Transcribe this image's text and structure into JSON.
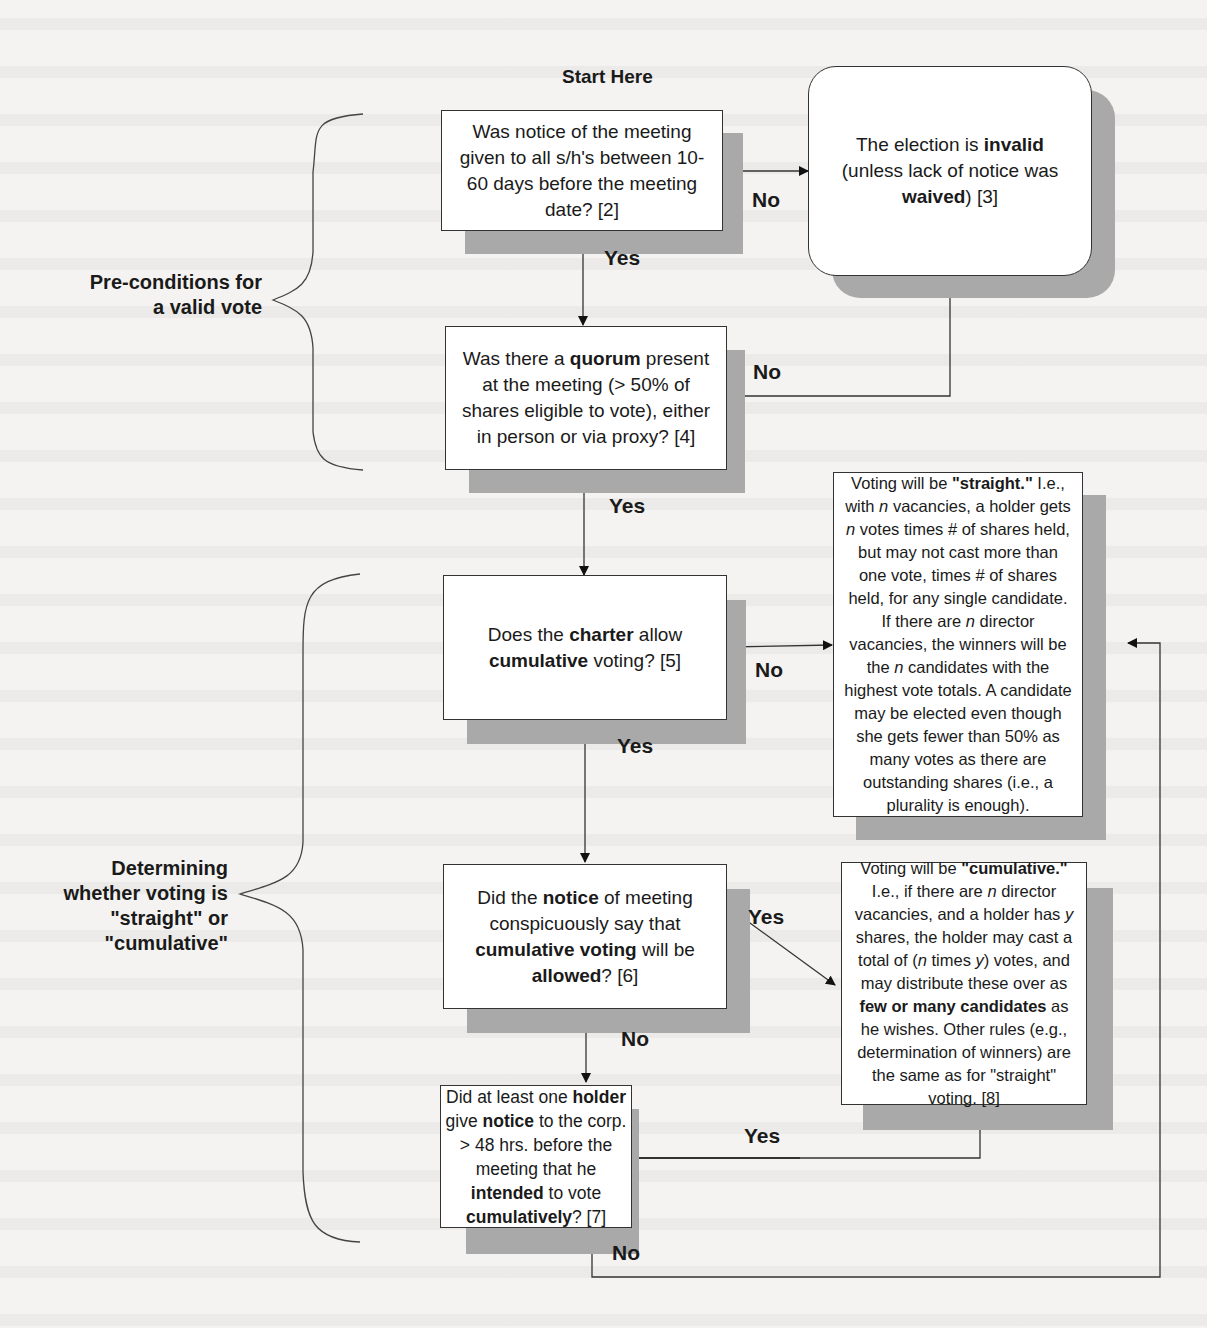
{
  "diagram": {
    "start_label": "Start Here",
    "side_labels": {
      "preconditions": [
        "Pre-conditions for",
        "a valid vote"
      ],
      "determining": [
        "Determining",
        "whether voting is",
        "\"straight\" or",
        "\"cumulative\""
      ]
    },
    "nodes": {
      "notice": {
        "segments": [
          {
            "t": "Was notice of the meeting given to all s/h's between 10-60 days before the meeting date? [2]"
          }
        ]
      },
      "invalid": {
        "segments": [
          {
            "t": "The election is  "
          },
          {
            "t": "invalid",
            "b": true
          },
          {
            "t": " (unless lack of notice was "
          },
          {
            "t": "waived",
            "b": true
          },
          {
            "t": ") [3]"
          }
        ]
      },
      "quorum": {
        "segments": [
          {
            "t": "Was there a "
          },
          {
            "t": "quorum",
            "b": true
          },
          {
            "t": " present at the meeting (> 50% of shares eligible to vote), either in person or via proxy? [4]"
          }
        ]
      },
      "charter": {
        "segments": [
          {
            "t": "Does the "
          },
          {
            "t": "charter",
            "b": true
          },
          {
            "t": " allow "
          },
          {
            "t": "cumulative",
            "b": true
          },
          {
            "t": " voting? [5]"
          }
        ]
      },
      "notice_cumulative": {
        "segments": [
          {
            "t": "Did the "
          },
          {
            "t": "notice",
            "b": true
          },
          {
            "t": " of meeting conspicuously say that "
          },
          {
            "t": "cumulative voting",
            "b": true
          },
          {
            "t": " will be "
          },
          {
            "t": "allowed",
            "b": true
          },
          {
            "t": "? [6]"
          }
        ]
      },
      "holder_notice": {
        "segments": [
          {
            "t": "Did at least one "
          },
          {
            "t": "holder",
            "b": true
          },
          {
            "t": " give "
          },
          {
            "t": "notice",
            "b": true
          },
          {
            "t": " to the corp. > 48 hrs. before the meeting that he "
          },
          {
            "t": "intended",
            "b": true
          },
          {
            "t": " to vote "
          },
          {
            "t": "cumulatively",
            "b": true
          },
          {
            "t": "? [7]"
          }
        ]
      },
      "straight": {
        "segments": [
          {
            "t": "Voting will be "
          },
          {
            "t": "\"straight.\"",
            "b": true
          },
          {
            "t": " I.e., with "
          },
          {
            "t": "n",
            "i": true
          },
          {
            "t": " vacancies, a holder gets "
          },
          {
            "t": "n",
            "i": true
          },
          {
            "t": " votes times # of shares held, but may not cast more than one vote, times # of shares held, for any single candidate. If there are "
          },
          {
            "t": "n",
            "i": true
          },
          {
            "t": " director vacancies, the winners will be the "
          },
          {
            "t": "n",
            "i": true
          },
          {
            "t": " candidates with the highest vote totals. A candidate may be elected even though she gets fewer than 50% as many votes as there are outstanding shares (i.e., a plurality is enough)."
          }
        ]
      },
      "cumulative": {
        "segments": [
          {
            "t": "Voting will be "
          },
          {
            "t": "\"cumulative.\"",
            "b": true
          },
          {
            "t": " I.e., if there are "
          },
          {
            "t": "n",
            "i": true
          },
          {
            "t": " director vacancies, and a holder has "
          },
          {
            "t": "y",
            "i": true
          },
          {
            "t": " shares, the holder may cast a total of ("
          },
          {
            "t": "n",
            "i": true
          },
          {
            "t": " times "
          },
          {
            "t": "y",
            "i": true
          },
          {
            "t": ") votes, and may distribute  these over as "
          },
          {
            "t": "few or many candidates",
            "b": true
          },
          {
            "t": " as he wishes. Other rules (e.g., determination of winners) are the same as for \"straight\" voting. [8]"
          }
        ]
      }
    },
    "edge_labels": {
      "notice_no": "No",
      "notice_yes": "Yes",
      "quorum_no": "No",
      "quorum_yes": "Yes",
      "charter_no": "No",
      "charter_yes": "Yes",
      "notice_cum_yes": "Yes",
      "notice_cum_no": "No",
      "holder_yes": "Yes",
      "holder_no": "No"
    }
  }
}
